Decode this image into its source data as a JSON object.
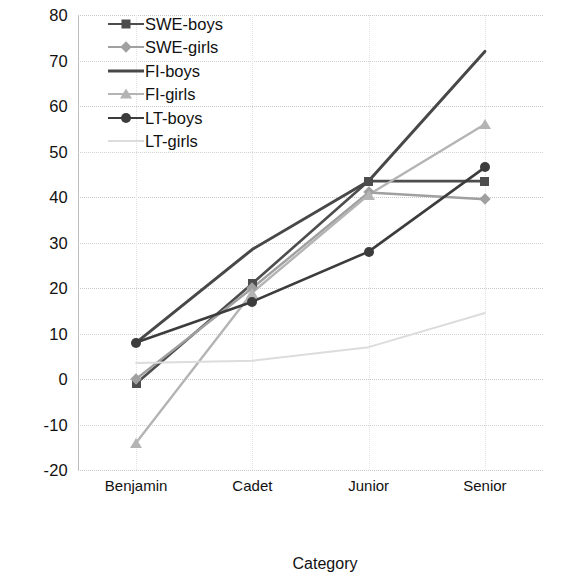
{
  "chart_data": {
    "type": "line",
    "title": "",
    "xlabel": "Category",
    "ylabel": "Average score",
    "categories": [
      "Benjamin",
      "Cadet",
      "Junior",
      "Senior"
    ],
    "ylim": [
      -20,
      80
    ],
    "ytick_labels": [
      "80",
      "70",
      "60",
      "50",
      "40",
      "30",
      "20",
      "10",
      "0",
      "-10",
      "-20"
    ],
    "ytick_values": [
      80,
      70,
      60,
      50,
      40,
      30,
      20,
      10,
      0,
      -10,
      -20
    ],
    "grid": true,
    "legend_position": "top-left-inside",
    "series": [
      {
        "name": "SWE-boys",
        "values": [
          -1,
          21,
          43.5,
          43.5
        ],
        "color": "#4d4d4d",
        "marker": "square",
        "width": 2.6
      },
      {
        "name": "SWE-girls",
        "values": [
          0,
          20,
          41,
          39.5
        ],
        "color": "#a0a0a0",
        "marker": "diamond",
        "width": 2.4
      },
      {
        "name": "FI-boys",
        "values": [
          8,
          28.5,
          43.5,
          72
        ],
        "color": "#484848",
        "marker": "none",
        "width": 3.0
      },
      {
        "name": "FI-girls",
        "values": [
          -14,
          19,
          40.5,
          56
        ],
        "color": "#b4b4b4",
        "marker": "triangle",
        "width": 2.4
      },
      {
        "name": "LT-boys",
        "values": [
          8,
          17,
          28,
          46.5
        ],
        "color": "#3c3c3c",
        "marker": "circle",
        "width": 2.6
      },
      {
        "name": "LT-girls",
        "values": [
          3.5,
          4,
          7,
          14.5
        ],
        "color": "#dcdcdc",
        "marker": "none",
        "width": 2.0
      }
    ]
  }
}
